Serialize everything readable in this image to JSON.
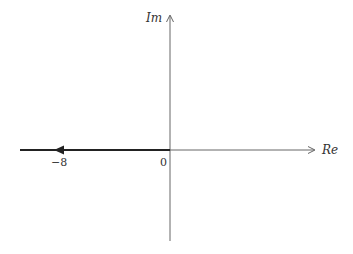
{
  "diagram": {
    "type": "root-locus-plane",
    "axes": {
      "x_label": "Re",
      "y_label": "Im"
    },
    "ticks": {
      "origin": "0",
      "neg_eight": "−8"
    },
    "locus": {
      "description": "Root locus branch on negative real axis from 0 toward −∞, arrow near −8",
      "start": 0,
      "arrow_at": -8,
      "direction": "left"
    },
    "colors": {
      "axis": "#555555",
      "locus": "#222222",
      "text": "#333333"
    }
  }
}
